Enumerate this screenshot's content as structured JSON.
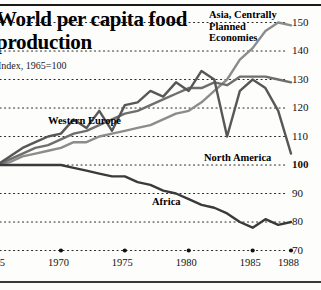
{
  "header": {
    "title": "World per capita food production",
    "subtitle": "Index, 1965=100"
  },
  "axes": {
    "y_ticks": [
      "150",
      "140",
      "130",
      "120",
      "110",
      "100",
      "90",
      "80",
      "70"
    ],
    "x_ticks": [
      "1965",
      "1970",
      "1975",
      "1980",
      "1985",
      "1988"
    ]
  },
  "series_labels": {
    "asia": "Asia, Centrally\nPlanned\nEconomies",
    "asia_line1": "Asia, Centrally",
    "asia_line2": "Planned",
    "asia_line3": "Economies",
    "western_europe": "Western Europe",
    "north_america": "North America",
    "africa": "Africa"
  },
  "chart_data": {
    "type": "line",
    "title": "World per capita food production",
    "subtitle": "Index, 1965=100",
    "xlabel": "",
    "ylabel": "Index, 1965=100",
    "xlim": [
      1965,
      1988
    ],
    "ylim": [
      70,
      155
    ],
    "grid": "dotted-horizontal",
    "legend": "inline-annotations",
    "x": [
      1965,
      1966,
      1967,
      1968,
      1969,
      1970,
      1971,
      1972,
      1973,
      1974,
      1975,
      1976,
      1977,
      1978,
      1979,
      1980,
      1981,
      1982,
      1983,
      1984,
      1985,
      1986,
      1987,
      1988
    ],
    "series": [
      {
        "name": "Asia, Centrally Planned Economies",
        "color": "#8c8c8c",
        "values": [
          100,
          101,
          103,
          104,
          105,
          106,
          108,
          108,
          110,
          111,
          112,
          113,
          114,
          116,
          118,
          119,
          122,
          126,
          130,
          137,
          141,
          147,
          150,
          149
        ]
      },
      {
        "name": "Western Europe",
        "color": "#6e6e6e",
        "values": [
          100,
          102,
          104,
          106,
          107,
          109,
          111,
          112,
          114,
          116,
          118,
          119,
          121,
          123,
          125,
          127,
          127,
          129,
          128,
          131,
          131,
          131,
          130,
          129
        ]
      },
      {
        "name": "North America",
        "color": "#575757",
        "values": [
          100,
          103,
          106,
          108,
          110,
          111,
          116,
          113,
          119,
          112,
          121,
          122,
          126,
          124,
          129,
          126,
          133,
          130,
          110,
          126,
          130,
          127,
          119,
          104
        ]
      },
      {
        "name": "Africa",
        "color": "#3a3a3a",
        "values": [
          100,
          100,
          100,
          100,
          100,
          100,
          99,
          98,
          97,
          96,
          96,
          94,
          93,
          91,
          90,
          88,
          86,
          85,
          83,
          80,
          78,
          81,
          79,
          80
        ]
      }
    ],
    "annotations": [
      {
        "text": "Asia, Centrally Planned Economies",
        "x": 1982,
        "y": 152
      },
      {
        "text": "Western Europe",
        "x": 1969,
        "y": 120
      },
      {
        "text": "North America",
        "x": 1984,
        "y": 103
      },
      {
        "text": "Africa",
        "x": 1978,
        "y": 88
      }
    ]
  }
}
